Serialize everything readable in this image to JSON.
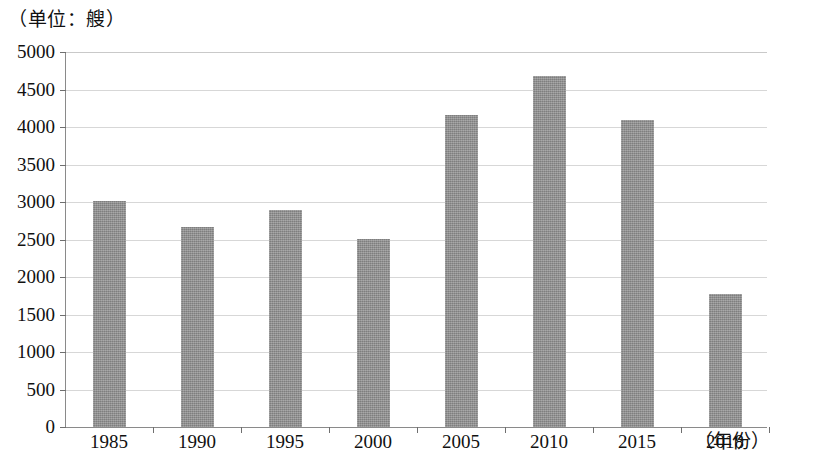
{
  "figure": {
    "unit_caption": "（单位：艘）",
    "x_axis_title": "（年份）"
  },
  "chart_data": {
    "type": "bar",
    "title": "",
    "subtitle": "",
    "xlabel": "（年份）",
    "ylabel": "（单位：艘）",
    "categories": [
      "1985",
      "1990",
      "1995",
      "2000",
      "2005",
      "2010",
      "2015",
      "2018"
    ],
    "values": [
      3010,
      2670,
      2900,
      2510,
      4160,
      4680,
      4090,
      1770
    ],
    "ylim": [
      0,
      5000
    ],
    "y_ticks": [
      0,
      500,
      1000,
      1500,
      2000,
      2500,
      3000,
      3500,
      4000,
      4500,
      5000
    ],
    "y_tick_labels": [
      "0",
      "500",
      "1000",
      "1500",
      "2000",
      "2500",
      "3000",
      "3500",
      "4000",
      "4500",
      "5000"
    ],
    "grid": true,
    "legend": false,
    "bar_color": "#909090",
    "gridline_color": "#d7d7d7",
    "axis_color": "#8a8a8a"
  }
}
